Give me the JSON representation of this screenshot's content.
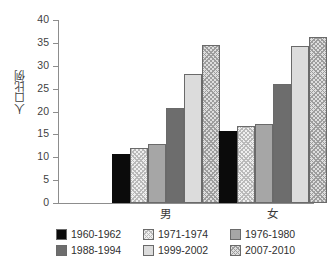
{
  "chart_data": {
    "type": "bar",
    "title": "",
    "subtitle": "",
    "xlabel": "",
    "ylabel": "人口比例",
    "categories": [
      "男",
      "女"
    ],
    "ylim": [
      0,
      40
    ],
    "yticks": [
      0,
      5,
      10,
      15,
      20,
      25,
      30,
      35,
      40
    ],
    "ytick_labels": [
      "0",
      "5",
      "10",
      "15",
      "20",
      "25",
      "30",
      "35",
      "40"
    ],
    "grid": false,
    "legend_position": "bottom",
    "series": [
      {
        "name": "1960-1962",
        "values": [
          10.7,
          15.8
        ],
        "pattern": "solid-black",
        "color": "#0b0b0b"
      },
      {
        "name": "1971-1974",
        "values": [
          12.1,
          16.8
        ],
        "pattern": "hatch-light",
        "color": "#efefef"
      },
      {
        "name": "1976-1980",
        "values": [
          12.8,
          17.2
        ],
        "pattern": "solid-midgray",
        "color": "#a6a6a6"
      },
      {
        "name": "1988-1994",
        "values": [
          20.7,
          26.1
        ],
        "pattern": "solid-darkgray",
        "color": "#6d6d6d"
      },
      {
        "name": "1999-2002",
        "values": [
          28.2,
          34.3
        ],
        "pattern": "solid-lightgray",
        "color": "#dcdcdc"
      },
      {
        "name": "2007-2010",
        "values": [
          34.5,
          36.3
        ],
        "pattern": "hatch-gray",
        "color": "#dedede"
      }
    ]
  }
}
